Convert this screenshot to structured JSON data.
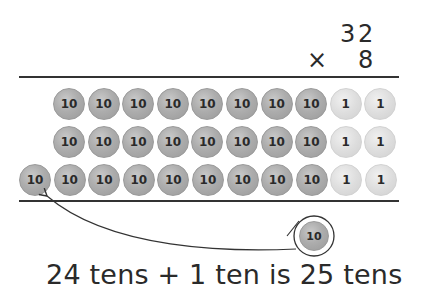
{
  "multiplication": {
    "multiplicand": {
      "tens_digit": "3",
      "ones_digit": "2"
    },
    "operator": "×",
    "multiplier": "8"
  },
  "place_value_chart": {
    "rows": [
      {
        "tens": [
          "10",
          "10",
          "10",
          "10",
          "10",
          "10",
          "10",
          "10"
        ],
        "ones": [
          "1",
          "1"
        ]
      },
      {
        "tens": [
          "10",
          "10",
          "10",
          "10",
          "10",
          "10",
          "10",
          "10"
        ],
        "ones": [
          "1",
          "1"
        ]
      },
      {
        "tens": [
          "10",
          "10",
          "10",
          "10",
          "10",
          "10",
          "10",
          "10",
          "10"
        ],
        "ones": [
          "1",
          "1"
        ]
      }
    ],
    "regrouped_counter": "10"
  },
  "colors": {
    "ten_counter": "#adadad",
    "one_counter": "#dedede",
    "line": "#333333"
  },
  "caption": "24 tens + 1 ten is 25 tens"
}
